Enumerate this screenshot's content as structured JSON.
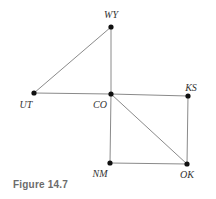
{
  "figure": {
    "caption": "Figure 14.7",
    "type": "graph",
    "nodes": [
      {
        "id": "WY",
        "label": "WY",
        "x": 111,
        "y": 27,
        "lx": 111,
        "ly": 18,
        "anchor": "middle"
      },
      {
        "id": "UT",
        "label": "UT",
        "x": 34,
        "y": 93,
        "lx": 26,
        "ly": 108,
        "anchor": "middle"
      },
      {
        "id": "CO",
        "label": "CO",
        "x": 111,
        "y": 94,
        "lx": 100,
        "ly": 108,
        "anchor": "middle"
      },
      {
        "id": "KS",
        "label": "KS",
        "x": 188,
        "y": 96,
        "lx": 191,
        "ly": 91,
        "anchor": "middle"
      },
      {
        "id": "NM",
        "label": "NM",
        "x": 110,
        "y": 163,
        "lx": 100,
        "ly": 177,
        "anchor": "middle"
      },
      {
        "id": "OK",
        "label": "OK",
        "x": 187,
        "y": 164,
        "lx": 187,
        "ly": 178,
        "anchor": "middle"
      }
    ],
    "edges": [
      [
        "WY",
        "UT"
      ],
      [
        "WY",
        "CO"
      ],
      [
        "UT",
        "CO"
      ],
      [
        "CO",
        "KS"
      ],
      [
        "CO",
        "NM"
      ],
      [
        "CO",
        "OK"
      ],
      [
        "KS",
        "OK"
      ],
      [
        "NM",
        "OK"
      ]
    ]
  }
}
